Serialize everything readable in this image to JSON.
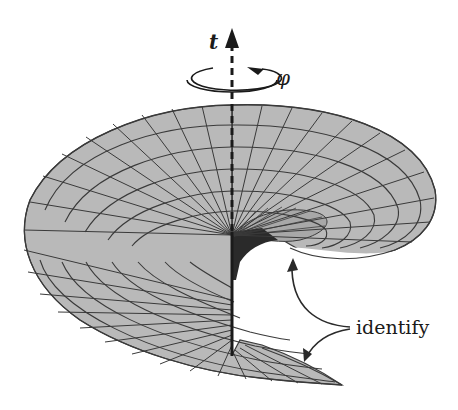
{
  "figure": {
    "labels": {
      "time_axis": "t",
      "angle": "φ",
      "identify": "identify"
    },
    "colors": {
      "surface_fill": "#b9b9b9",
      "grid_lines": "#3a3a3a",
      "axis": "#1a1a1a",
      "shadow": "#2a2a2a",
      "background": "#ffffff"
    }
  }
}
